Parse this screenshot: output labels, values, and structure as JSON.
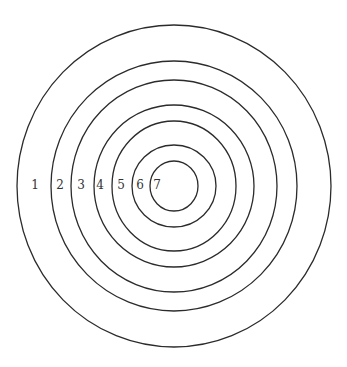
{
  "diagram": {
    "type": "concentric-circles",
    "center": {
      "x": 174,
      "y": 186
    },
    "stroke_color": "#2b2b2b",
    "background": "#ffffff",
    "rings": [
      {
        "label": "1",
        "rx": 157,
        "ry": 161,
        "label_x": 35
      },
      {
        "label": "2",
        "rx": 123,
        "ry": 125,
        "label_x": 60
      },
      {
        "label": "3",
        "rx": 103,
        "ry": 106,
        "label_x": 81
      },
      {
        "label": "4",
        "rx": 80,
        "ry": 81,
        "label_x": 100
      },
      {
        "label": "5",
        "rx": 62,
        "ry": 65,
        "label_x": 121
      },
      {
        "label": "6",
        "rx": 42,
        "ry": 41,
        "label_x": 140
      },
      {
        "label": "7",
        "rx": 24,
        "ry": 25,
        "label_x": 157
      }
    ]
  }
}
